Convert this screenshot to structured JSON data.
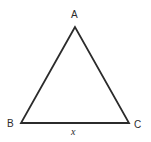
{
  "figure": {
    "kind": "geometry-diagram",
    "shape": "triangle",
    "canvas": {
      "width": 151,
      "height": 142,
      "background": "#ffffff"
    },
    "stroke": {
      "color": "#2b2b2b",
      "width": 1.8,
      "linejoin": "miter"
    },
    "vertices": [
      {
        "name": "A",
        "label": "A",
        "x": 75,
        "y": 27,
        "label_x": 75,
        "label_y": 15,
        "position": "apex"
      },
      {
        "name": "B",
        "label": "B",
        "x": 21,
        "y": 123,
        "label_x": 11,
        "label_y": 124,
        "position": "bottom-left"
      },
      {
        "name": "C",
        "label": "C",
        "x": 129,
        "y": 123,
        "label_x": 138,
        "label_y": 125,
        "position": "bottom-right"
      }
    ],
    "edges": [
      {
        "name": "AB",
        "from": "A",
        "to": "B",
        "label": ""
      },
      {
        "name": "AC",
        "from": "A",
        "to": "C",
        "label": ""
      },
      {
        "name": "BC",
        "from": "B",
        "to": "C",
        "label": "x"
      }
    ],
    "side_labels": [
      {
        "name": "base-length",
        "text": "x",
        "italic": true,
        "edge": "BC",
        "x": 75,
        "y": 132
      }
    ]
  }
}
